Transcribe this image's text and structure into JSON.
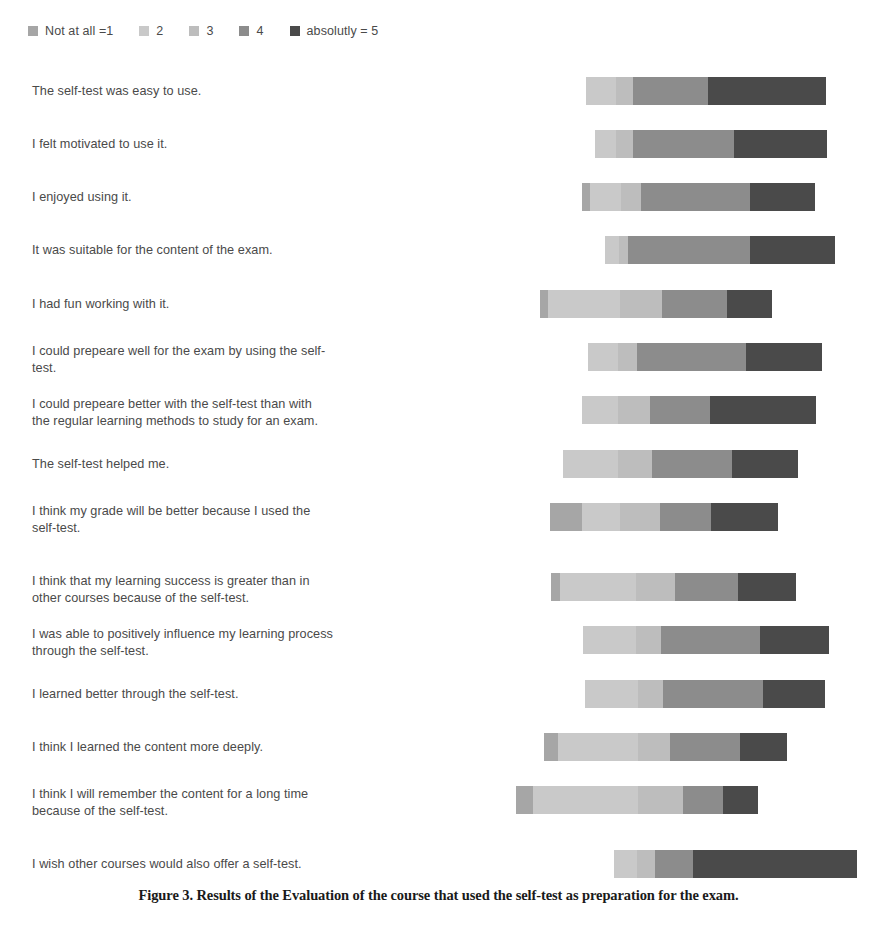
{
  "legend": {
    "items": [
      {
        "label": "Not at all =1",
        "color": "#a6a6a6"
      },
      {
        "label": "2",
        "color": "#c9c9c9"
      },
      {
        "label": "3",
        "color": "#bdbdbd"
      },
      {
        "label": "4",
        "color": "#8c8c8c"
      },
      {
        "label": "absolutly = 5",
        "color": "#4a4a4a"
      }
    ]
  },
  "caption": {
    "text": "Figure 3. Results of the Evaluation of the course that used the self-test as preparation for the exam."
  },
  "chart_data": {
    "type": "bar",
    "subtype": "diverging-stacked-likert",
    "title": "",
    "xlabel": "",
    "ylabel": "",
    "legend_position": "top-left",
    "grid": false,
    "scale_labels": [
      "Not at all =1",
      "2",
      "3",
      "4",
      "absolutly = 5"
    ],
    "colors": [
      "#a6a6a6",
      "#c9c9c9",
      "#bdbdbd",
      "#8c8c8c",
      "#4a4a4a"
    ],
    "pixel_axis": {
      "left": 510,
      "right": 860,
      "note": "bar x positions given in screenshot pixel coords"
    },
    "categories": [
      "The self-test was easy to use.",
      "I felt motivated to use it.",
      "I enjoyed using it.",
      "It was suitable for the content of the exam.",
      "I had fun working with it.",
      "I could prepeare well for the exam by using the self-test.",
      "I could prepeare better with the self-test than with the regular learning methods to study for an exam.",
      "The self-test helped me.",
      "I think my grade will be better because I used the self-test.",
      "I think that my learning success is greater than in other courses because of the self-test.",
      "I was able to positively influence my learning process through the self-test.",
      "I learned better through the self-test.",
      "I think I learned the content more deeply.",
      "I think I will remember the content for a long time because of the self-test.",
      "I wish other courses would also offer a self-test."
    ],
    "rows": [
      {
        "label": "The self-test was easy to use.",
        "label_lines": [
          "The self-test was easy to use."
        ],
        "bar_start": 586,
        "top": 17,
        "segments": [
          {
            "name": "Not at all =1",
            "start": 586,
            "end": 586,
            "width": 0,
            "color": "#a6a6a6"
          },
          {
            "name": "2",
            "start": 586,
            "end": 616,
            "width": 30,
            "color": "#c9c9c9"
          },
          {
            "name": "3",
            "start": 616,
            "end": 633,
            "width": 17,
            "color": "#bdbdbd"
          },
          {
            "name": "4",
            "start": 633,
            "end": 708,
            "width": 75,
            "color": "#8c8c8c"
          },
          {
            "name": "absolutly = 5",
            "start": 708,
            "end": 826,
            "width": 118,
            "color": "#4a4a4a"
          }
        ]
      },
      {
        "label": "I felt motivated to use it.",
        "label_lines": [
          "I felt motivated to use it."
        ],
        "bar_start": 595,
        "top": 70,
        "segments": [
          {
            "name": "Not at all =1",
            "start": 595,
            "end": 595,
            "width": 0,
            "color": "#a6a6a6"
          },
          {
            "name": "2",
            "start": 595,
            "end": 616,
            "width": 21,
            "color": "#c9c9c9"
          },
          {
            "name": "3",
            "start": 616,
            "end": 633,
            "width": 17,
            "color": "#bdbdbd"
          },
          {
            "name": "4",
            "start": 633,
            "end": 734,
            "width": 101,
            "color": "#8c8c8c"
          },
          {
            "name": "absolutly = 5",
            "start": 734,
            "end": 827,
            "width": 93,
            "color": "#4a4a4a"
          }
        ]
      },
      {
        "label": "I enjoyed using it.",
        "label_lines": [
          "I enjoyed using it."
        ],
        "bar_start": 582,
        "top": 123,
        "segments": [
          {
            "name": "Not at all =1",
            "start": 582,
            "end": 590,
            "width": 8,
            "color": "#a6a6a6"
          },
          {
            "name": "2",
            "start": 590,
            "end": 621,
            "width": 31,
            "color": "#c9c9c9"
          },
          {
            "name": "3",
            "start": 621,
            "end": 641,
            "width": 20,
            "color": "#bdbdbd"
          },
          {
            "name": "4",
            "start": 641,
            "end": 750,
            "width": 109,
            "color": "#8c8c8c"
          },
          {
            "name": "absolutly = 5",
            "start": 750,
            "end": 815,
            "width": 65,
            "color": "#4a4a4a"
          }
        ]
      },
      {
        "label": "It was suitable for the content of the exam.",
        "label_lines": [
          "It was suitable for the content of the exam."
        ],
        "bar_start": 605,
        "top": 176,
        "segments": [
          {
            "name": "Not at all =1",
            "start": 605,
            "end": 605,
            "width": 0,
            "color": "#a6a6a6"
          },
          {
            "name": "2",
            "start": 605,
            "end": 619,
            "width": 14,
            "color": "#c9c9c9"
          },
          {
            "name": "3",
            "start": 619,
            "end": 628,
            "width": 9,
            "color": "#bdbdbd"
          },
          {
            "name": "4",
            "start": 628,
            "end": 750,
            "width": 122,
            "color": "#8c8c8c"
          },
          {
            "name": "absolutly = 5",
            "start": 750,
            "end": 835,
            "width": 85,
            "color": "#4a4a4a"
          }
        ]
      },
      {
        "label": "I had fun working with it.",
        "label_lines": [
          "I had fun working with it."
        ],
        "bar_start": 540,
        "top": 230,
        "segments": [
          {
            "name": "Not at all =1",
            "start": 540,
            "end": 548,
            "width": 8,
            "color": "#a6a6a6"
          },
          {
            "name": "2",
            "start": 548,
            "end": 620,
            "width": 72,
            "color": "#c9c9c9"
          },
          {
            "name": "3",
            "start": 620,
            "end": 662,
            "width": 42,
            "color": "#bdbdbd"
          },
          {
            "name": "4",
            "start": 662,
            "end": 727,
            "width": 65,
            "color": "#8c8c8c"
          },
          {
            "name": "absolutly = 5",
            "start": 727,
            "end": 772,
            "width": 45,
            "color": "#4a4a4a"
          }
        ]
      },
      {
        "label": "I could prepeare well for the exam by using the self-test.",
        "label_lines": [
          "I could prepeare well for the exam by using the self-",
          "test."
        ],
        "bar_start": 588,
        "top": 283,
        "segments": [
          {
            "name": "Not at all =1",
            "start": 588,
            "end": 588,
            "width": 0,
            "color": "#a6a6a6"
          },
          {
            "name": "2",
            "start": 588,
            "end": 618,
            "width": 30,
            "color": "#c9c9c9"
          },
          {
            "name": "3",
            "start": 618,
            "end": 637,
            "width": 19,
            "color": "#bdbdbd"
          },
          {
            "name": "4",
            "start": 637,
            "end": 746,
            "width": 109,
            "color": "#8c8c8c"
          },
          {
            "name": "absolutly = 5",
            "start": 746,
            "end": 822,
            "width": 76,
            "color": "#4a4a4a"
          }
        ]
      },
      {
        "label": "I could prepeare better with the self-test than with the regular learning methods to study for an exam.",
        "label_lines": [
          "I could prepeare better with the self-test than with",
          "the regular learning methods to study for an exam."
        ],
        "bar_start": 582,
        "top": 336,
        "segments": [
          {
            "name": "Not at all =1",
            "start": 582,
            "end": 582,
            "width": 0,
            "color": "#a6a6a6"
          },
          {
            "name": "2",
            "start": 582,
            "end": 618,
            "width": 36,
            "color": "#c9c9c9"
          },
          {
            "name": "3",
            "start": 618,
            "end": 650,
            "width": 32,
            "color": "#bdbdbd"
          },
          {
            "name": "4",
            "start": 650,
            "end": 710,
            "width": 60,
            "color": "#8c8c8c"
          },
          {
            "name": "absolutly = 5",
            "start": 710,
            "end": 816,
            "width": 106,
            "color": "#4a4a4a"
          }
        ]
      },
      {
        "label": "The self-test helped me.",
        "label_lines": [
          "The self-test helped me."
        ],
        "bar_start": 563,
        "top": 390,
        "segments": [
          {
            "name": "Not at all =1",
            "start": 563,
            "end": 563,
            "width": 0,
            "color": "#a6a6a6"
          },
          {
            "name": "2",
            "start": 563,
            "end": 618,
            "width": 55,
            "color": "#c9c9c9"
          },
          {
            "name": "3",
            "start": 618,
            "end": 652,
            "width": 34,
            "color": "#bdbdbd"
          },
          {
            "name": "4",
            "start": 652,
            "end": 732,
            "width": 80,
            "color": "#8c8c8c"
          },
          {
            "name": "absolutly = 5",
            "start": 732,
            "end": 798,
            "width": 66,
            "color": "#4a4a4a"
          }
        ]
      },
      {
        "label": "I think my grade will be better because I used the self-test.",
        "label_lines": [
          "I think my grade will be better because I used the",
          "self-test."
        ],
        "bar_start": 550,
        "top": 443,
        "segments": [
          {
            "name": "Not at all =1",
            "start": 550,
            "end": 582,
            "width": 32,
            "color": "#a6a6a6"
          },
          {
            "name": "2",
            "start": 582,
            "end": 620,
            "width": 38,
            "color": "#c9c9c9"
          },
          {
            "name": "3",
            "start": 620,
            "end": 660,
            "width": 40,
            "color": "#bdbdbd"
          },
          {
            "name": "4",
            "start": 660,
            "end": 711,
            "width": 51,
            "color": "#8c8c8c"
          },
          {
            "name": "absolutly = 5",
            "start": 711,
            "end": 778,
            "width": 67,
            "color": "#4a4a4a"
          }
        ]
      },
      {
        "label": "I think that my learning success is greater than in other courses because of the self-test.",
        "label_lines": [
          "I think that my learning success is greater than in",
          "other courses because of the self-test."
        ],
        "bar_start": 551,
        "top": 513,
        "segments": [
          {
            "name": "Not at all =1",
            "start": 551,
            "end": 560,
            "width": 9,
            "color": "#a6a6a6"
          },
          {
            "name": "2",
            "start": 560,
            "end": 636,
            "width": 76,
            "color": "#c9c9c9"
          },
          {
            "name": "3",
            "start": 636,
            "end": 675,
            "width": 39,
            "color": "#bdbdbd"
          },
          {
            "name": "4",
            "start": 675,
            "end": 738,
            "width": 63,
            "color": "#8c8c8c"
          },
          {
            "name": "absolutly = 5",
            "start": 738,
            "end": 796,
            "width": 58,
            "color": "#4a4a4a"
          }
        ]
      },
      {
        "label": "I was able to positively influence my learning process through the self-test.",
        "label_lines": [
          "I was able to positively influence my learning process",
          "through the self-test."
        ],
        "bar_start": 583,
        "top": 566,
        "segments": [
          {
            "name": "Not at all =1",
            "start": 583,
            "end": 583,
            "width": 0,
            "color": "#a6a6a6"
          },
          {
            "name": "2",
            "start": 583,
            "end": 636,
            "width": 53,
            "color": "#c9c9c9"
          },
          {
            "name": "3",
            "start": 636,
            "end": 661,
            "width": 25,
            "color": "#bdbdbd"
          },
          {
            "name": "4",
            "start": 661,
            "end": 760,
            "width": 99,
            "color": "#8c8c8c"
          },
          {
            "name": "absolutly = 5",
            "start": 760,
            "end": 829,
            "width": 69,
            "color": "#4a4a4a"
          }
        ]
      },
      {
        "label": "I learned better through the self-test.",
        "label_lines": [
          "I learned better through the self-test."
        ],
        "bar_start": 585,
        "top": 620,
        "segments": [
          {
            "name": "Not at all =1",
            "start": 585,
            "end": 585,
            "width": 0,
            "color": "#a6a6a6"
          },
          {
            "name": "2",
            "start": 585,
            "end": 638,
            "width": 53,
            "color": "#c9c9c9"
          },
          {
            "name": "3",
            "start": 638,
            "end": 663,
            "width": 25,
            "color": "#bdbdbd"
          },
          {
            "name": "4",
            "start": 663,
            "end": 763,
            "width": 100,
            "color": "#8c8c8c"
          },
          {
            "name": "absolutly = 5",
            "start": 763,
            "end": 825,
            "width": 62,
            "color": "#4a4a4a"
          }
        ]
      },
      {
        "label": "I think I learned the content more deeply.",
        "label_lines": [
          "I think I learned the content more deeply."
        ],
        "bar_start": 544,
        "top": 673,
        "segments": [
          {
            "name": "Not at all =1",
            "start": 544,
            "end": 558,
            "width": 14,
            "color": "#a6a6a6"
          },
          {
            "name": "2",
            "start": 558,
            "end": 638,
            "width": 80,
            "color": "#c9c9c9"
          },
          {
            "name": "3",
            "start": 638,
            "end": 670,
            "width": 32,
            "color": "#bdbdbd"
          },
          {
            "name": "4",
            "start": 670,
            "end": 740,
            "width": 70,
            "color": "#8c8c8c"
          },
          {
            "name": "absolutly = 5",
            "start": 740,
            "end": 787,
            "width": 47,
            "color": "#4a4a4a"
          }
        ]
      },
      {
        "label": "I think I will remember the content for a long time because of the self-test.",
        "label_lines": [
          "I think I will remember the content for a long time",
          "because of the self-test."
        ],
        "bar_start": 516,
        "top": 726,
        "segments": [
          {
            "name": "Not at all =1",
            "start": 516,
            "end": 533,
            "width": 17,
            "color": "#a6a6a6"
          },
          {
            "name": "2",
            "start": 533,
            "end": 638,
            "width": 105,
            "color": "#c9c9c9"
          },
          {
            "name": "3",
            "start": 638,
            "end": 683,
            "width": 45,
            "color": "#bdbdbd"
          },
          {
            "name": "4",
            "start": 683,
            "end": 723,
            "width": 40,
            "color": "#8c8c8c"
          },
          {
            "name": "absolutly = 5",
            "start": 723,
            "end": 758,
            "width": 35,
            "color": "#4a4a4a"
          }
        ]
      },
      {
        "label": "I wish other courses would also offer a self-test.",
        "label_lines": [
          "I wish other courses would also offer a self-test."
        ],
        "bar_start": 614,
        "top": 790,
        "segments": [
          {
            "name": "Not at all =1",
            "start": 614,
            "end": 614,
            "width": 0,
            "color": "#a6a6a6"
          },
          {
            "name": "2",
            "start": 614,
            "end": 637,
            "width": 23,
            "color": "#c9c9c9"
          },
          {
            "name": "3",
            "start": 637,
            "end": 655,
            "width": 18,
            "color": "#bdbdbd"
          },
          {
            "name": "4",
            "start": 655,
            "end": 693,
            "width": 38,
            "color": "#8c8c8c"
          },
          {
            "name": "absolutly = 5",
            "start": 693,
            "end": 857,
            "width": 164,
            "color": "#4a4a4a"
          }
        ]
      }
    ]
  }
}
